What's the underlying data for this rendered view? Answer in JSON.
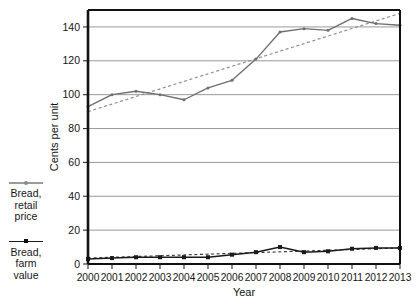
{
  "chart_data": {
    "type": "line",
    "title": "",
    "xlabel": "Year",
    "ylabel": "Cents per unit",
    "categories": [
      "2000",
      "2001",
      "2002",
      "2003",
      "2004",
      "2005",
      "2006",
      "2007",
      "2008",
      "2009",
      "2010",
      "2011",
      "2012",
      "2013"
    ],
    "x": [
      2000,
      2001,
      2002,
      2003,
      2004,
      2005,
      2006,
      2007,
      2008,
      2009,
      2010,
      2011,
      2012,
      2013
    ],
    "ylim": [
      0,
      150
    ],
    "xlim": [
      2000,
      2013
    ],
    "yticks": [
      0,
      20,
      40,
      60,
      80,
      100,
      120,
      140
    ],
    "ytick_labels": [
      "0",
      "20",
      "40",
      "60",
      "80",
      "100",
      "120",
      "140"
    ],
    "xtick_labels": [
      "2000",
      "2001",
      "2002",
      "2003",
      "2004",
      "2005",
      "2006",
      "2007",
      "2008",
      "2009",
      "2010",
      "2011",
      "2012",
      "2013"
    ],
    "grid": "horizontal",
    "legend_position": "left-outside",
    "series": [
      {
        "name": "Bread, retail price",
        "color": "#6e6e6e",
        "marker": "dot",
        "style": "solid",
        "values": [
          93,
          100,
          102,
          100,
          97,
          104,
          108.5,
          121,
          137,
          139,
          138,
          145,
          142,
          141
        ]
      },
      {
        "name": "Bread, farm value",
        "color": "#1a1a1a",
        "marker": "square",
        "style": "solid",
        "values": [
          3,
          3.5,
          4,
          4,
          4,
          4,
          5.5,
          7,
          10,
          7,
          7.5,
          9,
          9.5,
          9.5
        ]
      }
    ],
    "trendlines": [
      {
        "name": "Bread, retail price trendline",
        "color": "#8a8a8a",
        "style": "dashed",
        "of_series": "Bread, retail price",
        "start_value": 90,
        "end_value": 148
      },
      {
        "name": "Bread, farm value trendline",
        "color": "#3a3a3a",
        "style": "dashed",
        "of_series": "Bread, farm value",
        "start_value": 3.5,
        "end_value": 9.5
      }
    ]
  },
  "legend": {
    "items": [
      {
        "label_line1": "Bread,",
        "label_line2": "retail",
        "label_line3": "price",
        "swatch": "gray-line-dot"
      },
      {
        "label_line1": "Bread,",
        "label_line2": "farm",
        "label_line3": "value",
        "swatch": "black-line-square"
      }
    ]
  },
  "axes": {
    "x_title": "Year",
    "y_title": "Cents per unit"
  }
}
